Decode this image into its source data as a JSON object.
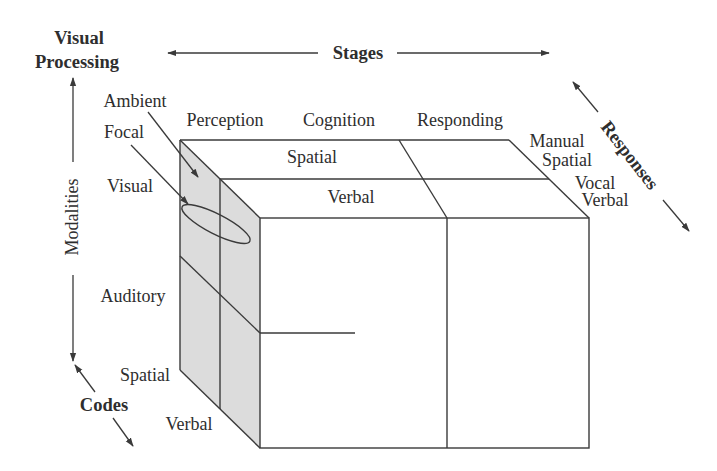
{
  "title": {
    "line1": "Visual",
    "line2": "Processing"
  },
  "axes": {
    "stages": "Stages",
    "modalities": "Modalities",
    "responses": "Responses",
    "codes": "Codes"
  },
  "visual_processing": [
    "Ambient",
    "Focal"
  ],
  "stages": [
    "Perception",
    "Cognition",
    "Responding"
  ],
  "top_codes": [
    "Spatial",
    "Verbal"
  ],
  "modalities": [
    "Visual",
    "Auditory"
  ],
  "side_codes": [
    "Spatial",
    "Verbal"
  ],
  "responses": [
    {
      "label": "Manual",
      "code": "Spatial"
    },
    {
      "label": "Vocal",
      "code": "Verbal"
    }
  ],
  "colors": {
    "line": "#3a3a3a",
    "shade": "#dcdcdc",
    "text": "#2e2e2e",
    "background": "#ffffff"
  }
}
